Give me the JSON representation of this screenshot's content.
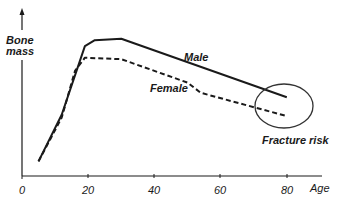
{
  "chart_data": {
    "type": "line",
    "title": "",
    "xlabel": "Age",
    "ylabel": "Bone mass",
    "xlim": [
      0,
      90
    ],
    "ylim": [
      0,
      100
    ],
    "x_ticks": [
      0,
      20,
      40,
      60,
      80
    ],
    "y_ticks": [],
    "grid": false,
    "legend": "none (direct line labels)",
    "series": [
      {
        "name": "Male",
        "style": "solid",
        "color": "#1a1a1a",
        "points": [
          [
            5,
            10
          ],
          [
            12,
            42
          ],
          [
            19,
            89
          ],
          [
            22,
            93
          ],
          [
            30,
            94
          ],
          [
            80,
            54
          ]
        ]
      },
      {
        "name": "Female",
        "style": "dashed",
        "color": "#1a1a1a",
        "points": [
          [
            5,
            10
          ],
          [
            12,
            40
          ],
          [
            16,
            72
          ],
          [
            19,
            81
          ],
          [
            30,
            80
          ],
          [
            50,
            64
          ],
          [
            54,
            57
          ],
          [
            80,
            41
          ]
        ]
      }
    ],
    "annotations": [
      {
        "text": "Fracture risk",
        "shape": "ellipse",
        "center_age": 79,
        "center_value": 48
      }
    ]
  },
  "labels": {
    "y_axis": [
      "Bone",
      "mass"
    ],
    "x_axis": "Age",
    "male": "Male",
    "female": "Female",
    "fracture": "Fracture risk",
    "ticks": [
      "0",
      "20",
      "40",
      "60",
      "80"
    ]
  },
  "colors": {
    "ink": "#1a1a1a",
    "background": "#ffffff"
  }
}
